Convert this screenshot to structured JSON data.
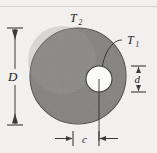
{
  "figure": {
    "kind": "engineering-cross-section-diagram",
    "background_color": "#f2f1ef",
    "fill_color": "#8e8e8e",
    "line_color": "#3a3a3a",
    "bore_color": "#ffffff"
  },
  "labels": {
    "outer_surface": {
      "symbol": "T",
      "subscript": "2",
      "text": "T2"
    },
    "inner_surface": {
      "symbol": "T",
      "subscript": "1",
      "text": "T1"
    },
    "outer_diameter": {
      "symbol": "D",
      "text": "D"
    },
    "inner_diameter": {
      "symbol": "d",
      "text": "d"
    },
    "eccentricity": {
      "symbol": "c",
      "text": "c"
    }
  },
  "geometry": {
    "outer_circle": {
      "cx": 78,
      "cy": 76,
      "r": 48
    },
    "inner_circle": {
      "cx": 99,
      "cy": 79,
      "r": 13
    },
    "dimension_D": {
      "x": 15,
      "y_top": 28,
      "y_bottom": 125
    },
    "dimension_d": {
      "x": 138,
      "y_top": 66,
      "y_bottom": 92
    },
    "dimension_c": {
      "y": 138,
      "x_left": 73,
      "x_right": 99
    },
    "center_line": {
      "x": 99,
      "y_top": 79,
      "y_bottom": 140
    }
  }
}
